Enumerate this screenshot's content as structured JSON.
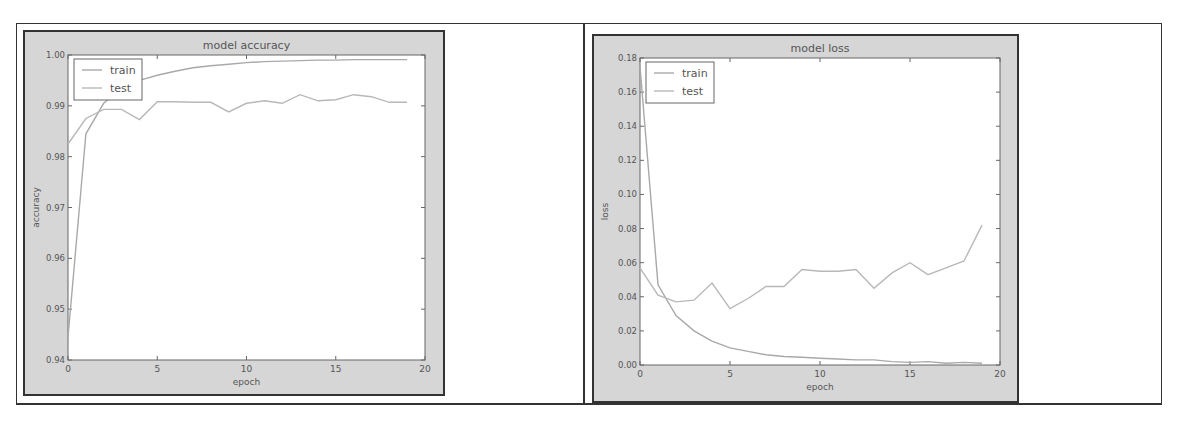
{
  "chart_data": [
    {
      "type": "line",
      "title": "model accuracy",
      "xlabel": "epoch",
      "ylabel": "accuracy",
      "xlim": [
        0,
        20
      ],
      "ylim": [
        0.94,
        1.0
      ],
      "xticks": [
        "0",
        "5",
        "10",
        "15",
        "20"
      ],
      "yticks": [
        "0.94",
        "0.95",
        "0.96",
        "0.97",
        "0.98",
        "0.99",
        "1.00"
      ],
      "grid": false,
      "legend": {
        "position": "upper left",
        "entries": [
          "train",
          "test"
        ]
      },
      "x": [
        0,
        1,
        2,
        3,
        4,
        5,
        6,
        7,
        8,
        9,
        10,
        11,
        12,
        13,
        14,
        15,
        16,
        17,
        18,
        19
      ],
      "series": [
        {
          "name": "train",
          "values": [
            0.9445,
            0.9845,
            0.9905,
            0.9935,
            0.995,
            0.996,
            0.9968,
            0.9975,
            0.9979,
            0.9982,
            0.9985,
            0.9987,
            0.9988,
            0.9989,
            0.999,
            0.999,
            0.9991,
            0.9991,
            0.9991,
            0.9991
          ]
        },
        {
          "name": "test",
          "values": [
            0.9825,
            0.9875,
            0.9893,
            0.9893,
            0.9873,
            0.9908,
            0.9908,
            0.9907,
            0.9907,
            0.9888,
            0.9905,
            0.991,
            0.9905,
            0.9922,
            0.991,
            0.9912,
            0.9922,
            0.9918,
            0.9907,
            0.9907
          ]
        }
      ]
    },
    {
      "type": "line",
      "title": "model loss",
      "xlabel": "epoch",
      "ylabel": "loss",
      "xlim": [
        0,
        20
      ],
      "ylim": [
        0.0,
        0.18
      ],
      "xticks": [
        "0",
        "5",
        "10",
        "15",
        "20"
      ],
      "yticks": [
        "0.00",
        "0.02",
        "0.04",
        "0.06",
        "0.08",
        "0.10",
        "0.12",
        "0.14",
        "0.16",
        "0.18"
      ],
      "grid": false,
      "legend": {
        "position": "upper left",
        "entries": [
          "train",
          "test"
        ]
      },
      "x": [
        0,
        1,
        2,
        3,
        4,
        5,
        6,
        7,
        8,
        9,
        10,
        11,
        12,
        13,
        14,
        15,
        16,
        17,
        18,
        19
      ],
      "series": [
        {
          "name": "train",
          "values": [
            0.175,
            0.047,
            0.029,
            0.02,
            0.014,
            0.01,
            0.008,
            0.006,
            0.005,
            0.0045,
            0.004,
            0.0035,
            0.003,
            0.003,
            0.002,
            0.0015,
            0.002,
            0.001,
            0.0015,
            0.001
          ]
        },
        {
          "name": "test",
          "values": [
            0.057,
            0.041,
            0.037,
            0.038,
            0.048,
            0.033,
            0.039,
            0.046,
            0.046,
            0.056,
            0.055,
            0.055,
            0.056,
            0.045,
            0.054,
            0.06,
            0.053,
            0.057,
            0.061,
            0.082
          ]
        }
      ]
    }
  ]
}
